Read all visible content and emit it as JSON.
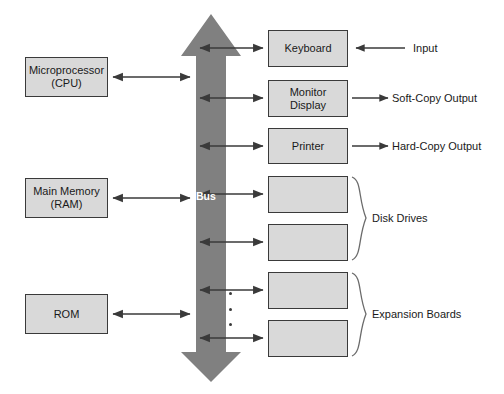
{
  "diagram": {
    "background_color": "#ffffff",
    "box_fill_color": "#d9d9d9",
    "box_border_color": "#3a3a3a",
    "bus_color": "#808080",
    "arrow_color": "#3a3a3a",
    "bus": {
      "label": "Bus",
      "arrowheads": "double-ended-vertical"
    },
    "left_components": [
      {
        "id": "cpu",
        "label": "Microprocessor\n(CPU)",
        "x": 25,
        "y": 57,
        "w": 83,
        "h": 40
      },
      {
        "id": "main-memory",
        "label": "Main Memory\n(RAM)",
        "x": 25,
        "y": 178,
        "w": 83,
        "h": 40
      },
      {
        "id": "rom",
        "label": "ROM",
        "x": 25,
        "y": 294,
        "w": 83,
        "h": 40
      }
    ],
    "right_components": [
      {
        "id": "keyboard",
        "label": "Keyboard",
        "x": 268,
        "y": 30,
        "w": 80,
        "h": 37
      },
      {
        "id": "monitor-display",
        "label": "Monitor\nDisplay",
        "x": 268,
        "y": 80,
        "w": 80,
        "h": 37
      },
      {
        "id": "printer",
        "label": "Printer",
        "x": 268,
        "y": 128,
        "w": 80,
        "h": 36
      },
      {
        "id": "disk-drive-1",
        "label": "",
        "x": 268,
        "y": 176,
        "w": 80,
        "h": 37
      },
      {
        "id": "disk-drive-2",
        "label": "",
        "x": 268,
        "y": 224,
        "w": 80,
        "h": 37
      },
      {
        "id": "expansion-board-1",
        "label": "",
        "x": 268,
        "y": 272,
        "w": 80,
        "h": 37
      },
      {
        "id": "expansion-board-2",
        "label": "",
        "x": 268,
        "y": 320,
        "w": 80,
        "h": 37
      }
    ],
    "io_labels": [
      {
        "id": "input",
        "text": "Input",
        "arrow_direction": "left",
        "x": 413,
        "y": 42
      },
      {
        "id": "soft-copy-output",
        "text": "Soft-Copy Output",
        "arrow_direction": "right",
        "x": 392,
        "y": 92
      },
      {
        "id": "hard-copy-output",
        "text": "Hard-Copy Output",
        "arrow_direction": "right",
        "x": 392,
        "y": 140
      }
    ],
    "group_labels": [
      {
        "id": "disk-drives",
        "text": "Disk Drives",
        "x": 372,
        "y": 212
      },
      {
        "id": "expansion-boards",
        "text": "Expansion Boards",
        "x": 372,
        "y": 308
      }
    ],
    "ellipsis": {
      "id": "vertical-ellipsis",
      "dot_count": 3,
      "x": 230,
      "y": 293
    }
  }
}
